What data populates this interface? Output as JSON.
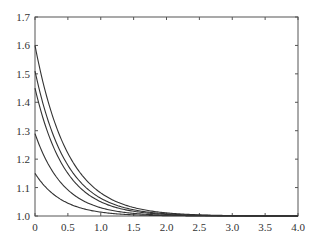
{
  "chart_data": {
    "type": "line",
    "title": "",
    "xlabel": "",
    "ylabel": "",
    "xlim": [
      0,
      4.0
    ],
    "ylim": [
      1.0,
      1.7
    ],
    "xticks": [
      "0",
      "0.5",
      "1.0",
      "1.5",
      "2.0",
      "2.5",
      "3.0",
      "3.5",
      "4.0"
    ],
    "yticks": [
      "1.0",
      "1.1",
      "1.2",
      "1.3",
      "1.4",
      "1.5",
      "1.6",
      "1.7"
    ],
    "grid": false,
    "legend": null,
    "line_color": "#333333",
    "model": "y = 1 + a * exp(-k x)",
    "x": [
      0,
      0.25,
      0.5,
      0.75,
      1.0,
      1.5,
      2.0,
      2.5,
      3.0,
      3.5,
      4.0
    ],
    "series": [
      {
        "name": "curve-1",
        "a": 0.6,
        "k": 2.0,
        "values": [
          1.6,
          1.364,
          1.221,
          1.134,
          1.081,
          1.03,
          1.011,
          1.004,
          1.001,
          1.001,
          1.0
        ]
      },
      {
        "name": "curve-2",
        "a": 0.51,
        "k": 2.1,
        "values": [
          1.51,
          1.301,
          1.178,
          1.105,
          1.063,
          1.022,
          1.008,
          1.003,
          1.001,
          1.0,
          1.0
        ]
      },
      {
        "name": "curve-3",
        "a": 0.45,
        "k": 2.2,
        "values": [
          1.45,
          1.259,
          1.15,
          1.086,
          1.05,
          1.017,
          1.006,
          1.002,
          1.001,
          1.0,
          1.0
        ]
      },
      {
        "name": "curve-4",
        "a": 0.29,
        "k": 2.3,
        "values": [
          1.29,
          1.163,
          1.092,
          1.052,
          1.029,
          1.009,
          1.003,
          1.001,
          1.0,
          1.0,
          1.0
        ]
      },
      {
        "name": "curve-5",
        "a": 0.15,
        "k": 2.4,
        "values": [
          1.15,
          1.082,
          1.045,
          1.025,
          1.014,
          1.004,
          1.001,
          1.0,
          1.0,
          1.0,
          1.0
        ]
      }
    ]
  }
}
